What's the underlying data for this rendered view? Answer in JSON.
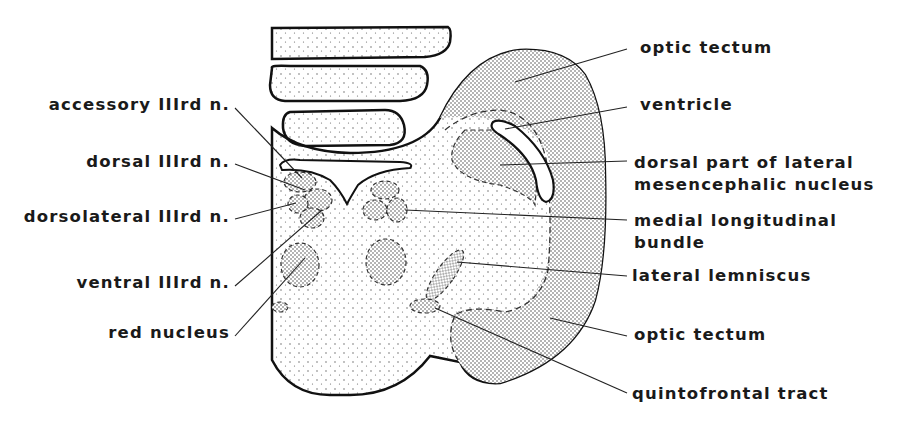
{
  "figure": {
    "type": "anatomical cross-section of midbrain (mesencephalon)",
    "colors": {
      "outline": "#111111",
      "leader": "#222222",
      "background": "#ffffff"
    }
  },
  "labels": {
    "left": [
      {
        "id": "accessory_iii",
        "text": "accessory IIIrd n."
      },
      {
        "id": "dorsal_iii",
        "text": "dorsal IIIrd n."
      },
      {
        "id": "dorsolateral_iii",
        "text": "dorsolateral IIIrd n."
      },
      {
        "id": "ventral_iii",
        "text": "ventral IIIrd n."
      },
      {
        "id": "red_nucleus",
        "text": "red nucleus"
      }
    ],
    "right": [
      {
        "id": "optic_tectum_top",
        "text": "optic tectum"
      },
      {
        "id": "ventricle",
        "text": "ventricle"
      },
      {
        "id": "dorsal_lmn_1",
        "text": "dorsal part of lateral"
      },
      {
        "id": "dorsal_lmn_2",
        "text": "mesencephalic nucleus"
      },
      {
        "id": "mlf_1",
        "text": "medial longitudinal"
      },
      {
        "id": "mlf_2",
        "text": "bundle"
      },
      {
        "id": "lateral_lemniscus",
        "text": "lateral lemniscus"
      },
      {
        "id": "optic_tectum_bottom",
        "text": "optic tectum"
      },
      {
        "id": "quintofrontal",
        "text": "quintofrontal tract"
      }
    ]
  }
}
